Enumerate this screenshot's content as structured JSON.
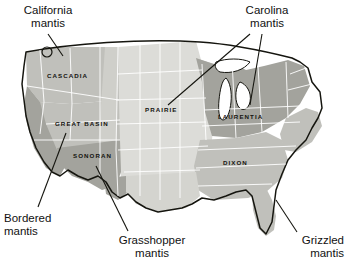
{
  "figure": {
    "kind": "biogeographic-region-map",
    "country": "United States",
    "background_color": "#ffffff"
  },
  "palette": {
    "outline": "#15150f",
    "state_border": "#ffffff",
    "leader_line": "#15150f",
    "region_light": "#dcdcd8",
    "region_medium": "#c0c0bb",
    "region_dark": "#a3a39d",
    "lake_fill": "#ffffff",
    "label_text": "#111111"
  },
  "regions": [
    {
      "id": "cascadia",
      "label": "CASCADIA",
      "shade": "#c0c0bb",
      "label_x": 47,
      "label_y": 78
    },
    {
      "id": "great-basin",
      "label": "GREAT BASIN",
      "shade": "#c0c0bb",
      "label_x": 55,
      "label_y": 126
    },
    {
      "id": "sonoran",
      "label": "SONORAN",
      "shade": "#a3a39d",
      "label_x": 73,
      "label_y": 158
    },
    {
      "id": "prairie",
      "label": "PRAIRIE",
      "shade": "#dcdcd8",
      "label_x": 145,
      "label_y": 112
    },
    {
      "id": "laurentia",
      "label": "LAURENTIA",
      "shade": "#a3a39d",
      "label_x": 218,
      "label_y": 119
    },
    {
      "id": "dixon",
      "label": "DIXON",
      "shade": "#c0c0bb",
      "label_x": 223,
      "label_y": 165
    }
  ],
  "callouts": [
    {
      "id": "california-mantis",
      "line1": "California",
      "line2": "mantis",
      "box_left": 5,
      "box_top": 4,
      "box_width": 86,
      "align": "center",
      "leaders": [
        {
          "x1": 48,
          "y1": 34,
          "x2": 63,
          "y2": 56
        }
      ]
    },
    {
      "id": "carolina-mantis",
      "line1": "Carolina",
      "line2": "mantis",
      "box_left": 228,
      "box_top": 4,
      "box_width": 78,
      "align": "center",
      "leaders": [
        {
          "x1": 250,
          "y1": 34,
          "x2": 168,
          "y2": 105
        },
        {
          "x1": 262,
          "y1": 34,
          "x2": 250,
          "y2": 105
        }
      ]
    },
    {
      "id": "bordered-mantis",
      "line1": "Bordered",
      "line2": "mantis",
      "box_left": 4,
      "box_top": 212,
      "box_width": 74,
      "align": "left",
      "leaders": [
        {
          "x1": 38,
          "y1": 207,
          "x2": 66,
          "y2": 133
        }
      ]
    },
    {
      "id": "grasshopper-mantis",
      "line1": "Grasshopper",
      "line2": "mantis",
      "box_left": 103,
      "box_top": 234,
      "box_width": 98,
      "align": "center",
      "leaders": [
        {
          "x1": 128,
          "y1": 231,
          "x2": 96,
          "y2": 166
        }
      ]
    },
    {
      "id": "grizzled-mantis",
      "line1": "Grizzled",
      "line2": "mantis",
      "box_left": 272,
      "box_top": 234,
      "box_width": 72,
      "align": "right",
      "leaders": [
        {
          "x1": 297,
          "y1": 232,
          "x2": 276,
          "y2": 200
        }
      ]
    }
  ]
}
